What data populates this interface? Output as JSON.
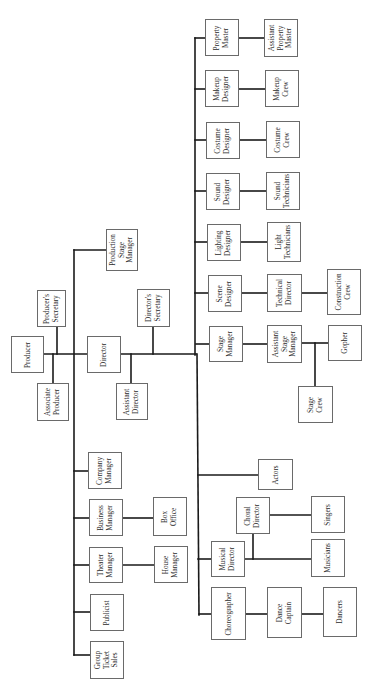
{
  "diagram": {
    "type": "organization-chart",
    "orientation": "rotated-90-counterclockwise",
    "line_color": "#1a1a1a",
    "box_border_color": "#6a6a6a",
    "nodes": [
      {
        "id": "producer",
        "label": "Producer",
        "x": 11,
        "y": 336,
        "w": 33,
        "h": 37
      },
      {
        "id": "producers_secretary",
        "label": "Producer's\nSecretary",
        "x": 37,
        "y": 290,
        "w": 29,
        "h": 37
      },
      {
        "id": "associate_producer",
        "label": "Associate\nProducer",
        "x": 37,
        "y": 383,
        "w": 32,
        "h": 38
      },
      {
        "id": "director",
        "label": "Director",
        "x": 87,
        "y": 336,
        "w": 34,
        "h": 37
      },
      {
        "id": "directors_secretary",
        "label": "Director's\nSecretary",
        "x": 137,
        "y": 289,
        "w": 33,
        "h": 38
      },
      {
        "id": "assistant_director",
        "label": "Assistant\nDirector",
        "x": 116,
        "y": 383,
        "w": 32,
        "h": 37
      },
      {
        "id": "production_stage_manager",
        "label": "Production\nStage\nManager",
        "x": 106,
        "y": 229,
        "w": 32,
        "h": 42
      },
      {
        "id": "property_master",
        "label": "Property\nMaster",
        "x": 205,
        "y": 19,
        "w": 34,
        "h": 37
      },
      {
        "id": "assistant_property_master",
        "label": "Assistant\nProperty\nMaster",
        "x": 264,
        "y": 19,
        "w": 34,
        "h": 38
      },
      {
        "id": "makeup_designer",
        "label": "Makeup\nDesigner",
        "x": 205,
        "y": 70,
        "w": 34,
        "h": 37
      },
      {
        "id": "makeup_crew",
        "label": "Makeup\nCrew",
        "x": 265,
        "y": 70,
        "w": 34,
        "h": 37
      },
      {
        "id": "costume_designer",
        "label": "Costume\nDesigner",
        "x": 206,
        "y": 122,
        "w": 34,
        "h": 37
      },
      {
        "id": "costume_crew",
        "label": "Costume\nCrew",
        "x": 266,
        "y": 121,
        "w": 34,
        "h": 37
      },
      {
        "id": "sound_designer",
        "label": "Sound\nDesigner",
        "x": 206,
        "y": 173,
        "w": 34,
        "h": 37
      },
      {
        "id": "sound_technicians",
        "label": "Sound\nTechnicians",
        "x": 266,
        "y": 172,
        "w": 34,
        "h": 38
      },
      {
        "id": "lighting_designer",
        "label": "Lighting\nDesigner",
        "x": 207,
        "y": 224,
        "w": 34,
        "h": 37
      },
      {
        "id": "light_technicians",
        "label": "Light\nTechnicians",
        "x": 267,
        "y": 222,
        "w": 34,
        "h": 40
      },
      {
        "id": "scene_designer",
        "label": "Scene\nDesigner",
        "x": 208,
        "y": 275,
        "w": 34,
        "h": 37
      },
      {
        "id": "technical_director",
        "label": "Technical\nDirector",
        "x": 267,
        "y": 274,
        "w": 35,
        "h": 38
      },
      {
        "id": "construction_crew",
        "label": "Construction\nCrew",
        "x": 327,
        "y": 269,
        "w": 34,
        "h": 46
      },
      {
        "id": "stage_manager",
        "label": "Stage\nManager",
        "x": 209,
        "y": 326,
        "w": 34,
        "h": 36
      },
      {
        "id": "assistant_stage_manager",
        "label": "Assistant\nStage\nManager",
        "x": 267,
        "y": 325,
        "w": 35,
        "h": 38
      },
      {
        "id": "gopher",
        "label": "Gopher",
        "x": 328,
        "y": 325,
        "w": 34,
        "h": 36
      },
      {
        "id": "stage_crew",
        "label": "Stage\nCrew",
        "x": 298,
        "y": 386,
        "w": 35,
        "h": 37
      },
      {
        "id": "actors",
        "label": "Actors",
        "x": 258,
        "y": 459,
        "w": 35,
        "h": 31
      },
      {
        "id": "choral_director",
        "label": "Choral\nDirector",
        "x": 236,
        "y": 497,
        "w": 34,
        "h": 37
      },
      {
        "id": "singers",
        "label": "Singers",
        "x": 311,
        "y": 496,
        "w": 34,
        "h": 37
      },
      {
        "id": "musical_director",
        "label": "Musical\nDirector",
        "x": 211,
        "y": 541,
        "w": 34,
        "h": 36
      },
      {
        "id": "musicians",
        "label": "Musicians",
        "x": 311,
        "y": 539,
        "w": 34,
        "h": 38
      },
      {
        "id": "choreographer",
        "label": "Choreographer",
        "x": 211,
        "y": 587,
        "w": 35,
        "h": 53
      },
      {
        "id": "dance_captain",
        "label": "Dance\nCaptain",
        "x": 267,
        "y": 587,
        "w": 35,
        "h": 51
      },
      {
        "id": "dancers",
        "label": "Dancers",
        "x": 323,
        "y": 587,
        "w": 34,
        "h": 50
      },
      {
        "id": "company_manager",
        "label": "Company\nManager",
        "x": 88,
        "y": 452,
        "w": 34,
        "h": 37
      },
      {
        "id": "business_manager",
        "label": "Business\nManager",
        "x": 89,
        "y": 499,
        "w": 34,
        "h": 37
      },
      {
        "id": "box_office",
        "label": "Box\nOffice",
        "x": 153,
        "y": 497,
        "w": 34,
        "h": 39
      },
      {
        "id": "theater_manager",
        "label": "Theater\nManager",
        "x": 89,
        "y": 547,
        "w": 34,
        "h": 36
      },
      {
        "id": "house_manager",
        "label": "House\nManager",
        "x": 154,
        "y": 546,
        "w": 34,
        "h": 37
      },
      {
        "id": "publicist",
        "label": "Publicist",
        "x": 90,
        "y": 594,
        "w": 34,
        "h": 37
      },
      {
        "id": "group_ticket_sales",
        "label": "Group\nTicket\nSales",
        "x": 90,
        "y": 641,
        "w": 34,
        "h": 38
      }
    ],
    "lines": [
      [
        44,
        354,
        87,
        354
      ],
      [
        57,
        327,
        57,
        354
      ],
      [
        53,
        354,
        53,
        383
      ],
      [
        74,
        250,
        74,
        655
      ],
      [
        74,
        250,
        106,
        250
      ],
      [
        121,
        354,
        196,
        354
      ],
      [
        153,
        327,
        153,
        354
      ],
      [
        131,
        354,
        131,
        383
      ],
      [
        195,
        38,
        195,
        355
      ],
      [
        197,
        354,
        199,
        615
      ],
      [
        195,
        38,
        205,
        38
      ],
      [
        195,
        89,
        205,
        89
      ],
      [
        195,
        140,
        206,
        140
      ],
      [
        195,
        191,
        206,
        191
      ],
      [
        195,
        242,
        207,
        242
      ],
      [
        195,
        293,
        208,
        293
      ],
      [
        196,
        344,
        209,
        344
      ],
      [
        239,
        38,
        264,
        38
      ],
      [
        239,
        89,
        265,
        89
      ],
      [
        240,
        140,
        266,
        140
      ],
      [
        240,
        191,
        266,
        191
      ],
      [
        241,
        242,
        267,
        242
      ],
      [
        242,
        293,
        267,
        293
      ],
      [
        302,
        293,
        327,
        293
      ],
      [
        243,
        344,
        267,
        344
      ],
      [
        302,
        343,
        328,
        343
      ],
      [
        315,
        343,
        315,
        386
      ],
      [
        198,
        475,
        258,
        475
      ],
      [
        198,
        559,
        211,
        559
      ],
      [
        245,
        559,
        311,
        559
      ],
      [
        253,
        534,
        253,
        559
      ],
      [
        270,
        515,
        311,
        515
      ],
      [
        199,
        614,
        211,
        614
      ],
      [
        246,
        614,
        267,
        614
      ],
      [
        302,
        614,
        323,
        614
      ],
      [
        74,
        471,
        88,
        471
      ],
      [
        74,
        518,
        89,
        518
      ],
      [
        123,
        518,
        153,
        518
      ],
      [
        74,
        565,
        89,
        565
      ],
      [
        123,
        565,
        154,
        565
      ],
      [
        74,
        612,
        90,
        612
      ],
      [
        74,
        655,
        90,
        655
      ]
    ]
  }
}
